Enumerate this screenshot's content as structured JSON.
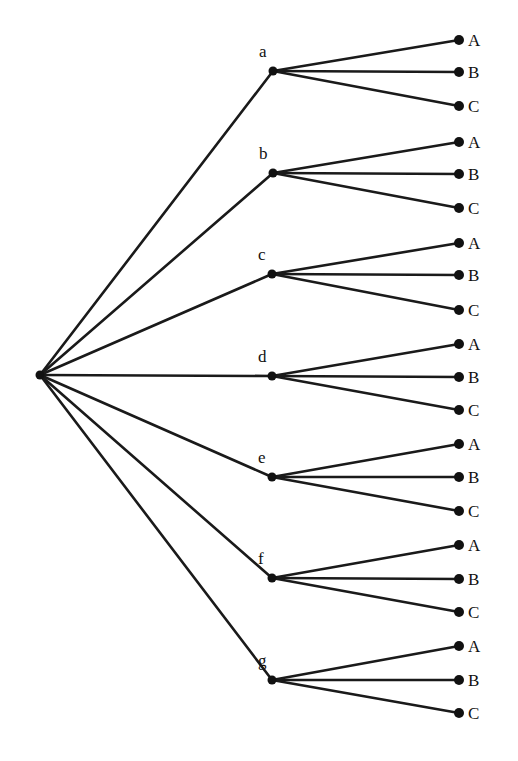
{
  "diagram": {
    "type": "tree",
    "root": {
      "x": 40,
      "y": 375
    },
    "leaf_x": 459,
    "colors": {
      "line": "#1a1a1a",
      "dot": "#111111",
      "background": "#ffffff"
    },
    "first_stage": [
      {
        "label": "a",
        "x": 273,
        "y": 71,
        "children": [
          {
            "label": "A",
            "y": 40
          },
          {
            "label": "B",
            "y": 72
          },
          {
            "label": "C",
            "y": 106
          }
        ]
      },
      {
        "label": "b",
        "x": 273,
        "y": 173,
        "children": [
          {
            "label": "A",
            "y": 142
          },
          {
            "label": "B",
            "y": 174
          },
          {
            "label": "C",
            "y": 208
          }
        ]
      },
      {
        "label": "c",
        "x": 272,
        "y": 274,
        "children": [
          {
            "label": "A",
            "y": 243
          },
          {
            "label": "B",
            "y": 275
          },
          {
            "label": "C",
            "y": 310
          }
        ]
      },
      {
        "label": "d",
        "x": 272,
        "y": 376,
        "children": [
          {
            "label": "A",
            "y": 344
          },
          {
            "label": "B",
            "y": 377
          },
          {
            "label": "C",
            "y": 410
          }
        ]
      },
      {
        "label": "e",
        "x": 272,
        "y": 477,
        "children": [
          {
            "label": "A",
            "y": 444
          },
          {
            "label": "B",
            "y": 477
          },
          {
            "label": "C",
            "y": 511
          }
        ]
      },
      {
        "label": "f",
        "x": 272,
        "y": 578,
        "children": [
          {
            "label": "A",
            "y": 545
          },
          {
            "label": "B",
            "y": 579
          },
          {
            "label": "C",
            "y": 612
          }
        ]
      },
      {
        "label": "g",
        "x": 272,
        "y": 680,
        "children": [
          {
            "label": "A",
            "y": 646
          },
          {
            "label": "B",
            "y": 680
          },
          {
            "label": "C",
            "y": 713
          }
        ]
      }
    ]
  }
}
